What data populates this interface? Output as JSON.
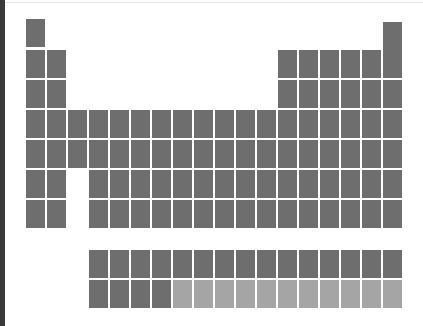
{
  "diagram": {
    "type": "periodic-table-silhouette",
    "colors": {
      "dark": "#6e6e6e",
      "light": "#a5a5a5",
      "background": "#ffffff"
    },
    "grid": {
      "origin_x": 26,
      "col_step": 21,
      "cell_w": 19,
      "cell_h": 28
    },
    "main_rows": [
      {
        "y": 19,
        "cols": [
          1
        ]
      },
      {
        "y": 22,
        "cols": [
          18
        ]
      },
      {
        "y": 50,
        "cols": [
          1,
          2,
          13,
          14,
          15,
          16,
          17,
          18
        ]
      },
      {
        "y": 80,
        "cols": [
          1,
          2,
          13,
          14,
          15,
          16,
          17,
          18
        ]
      },
      {
        "y": 110,
        "cols": [
          1,
          2,
          3,
          4,
          5,
          6,
          7,
          8,
          9,
          10,
          11,
          12,
          13,
          14,
          15,
          16,
          17,
          18
        ]
      },
      {
        "y": 140,
        "cols": [
          1,
          2,
          3,
          4,
          5,
          6,
          7,
          8,
          9,
          10,
          11,
          12,
          13,
          14,
          15,
          16,
          17,
          18
        ]
      },
      {
        "y": 170,
        "cols": [
          1,
          2,
          4,
          5,
          6,
          7,
          8,
          9,
          10,
          11,
          12,
          13,
          14,
          15,
          16,
          17,
          18
        ]
      },
      {
        "y": 200,
        "cols": [
          1,
          2,
          4,
          5,
          6,
          7,
          8,
          9,
          10,
          11,
          12,
          13,
          14,
          15,
          16,
          17,
          18
        ]
      }
    ],
    "f_block": [
      {
        "y": 250,
        "start_col": 4,
        "count": 15,
        "light_from": 99
      },
      {
        "y": 280,
        "start_col": 4,
        "count": 15,
        "light_from": 4
      }
    ]
  }
}
